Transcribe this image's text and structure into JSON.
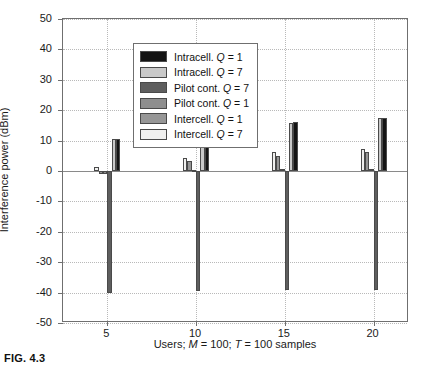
{
  "figure": {
    "caption": "FIG. 4.3"
  },
  "chart_data": {
    "type": "bar",
    "title": "",
    "xlabel": "Users; M = 100; T = 100 samples",
    "ylabel": "Interference power (dBm)",
    "categories": [
      "5",
      "10",
      "15",
      "20"
    ],
    "xlim": [
      2.5,
      22.0
    ],
    "ylim": [
      -50,
      50
    ],
    "ytick_labels": [
      "50",
      "40",
      "30",
      "20",
      "10",
      "0",
      "-10",
      "-20",
      "-30",
      "-40",
      "-50"
    ],
    "yticks": [
      50,
      40,
      30,
      20,
      10,
      0,
      -10,
      -20,
      -30,
      -40,
      -50
    ],
    "xtick_labels": [
      "5",
      "10",
      "15",
      "20"
    ],
    "xticks": [
      5,
      10,
      15,
      20
    ],
    "grid": "dotted-both-axes",
    "legend_position": "upper-left",
    "series": [
      {
        "name": "Intercell. Q = 7",
        "color": "#f0f0ef",
        "values": [
          1.2,
          4.2,
          6.1,
          7.3
        ]
      },
      {
        "name": "Intercell. Q = 1",
        "color": "#969696",
        "values": [
          -0.9,
          3.2,
          5.0,
          6.1
        ]
      },
      {
        "name": "Pilot cont. Q = 1",
        "color": "#8e8e8e",
        "values": [
          -1.0,
          0.2,
          0.5,
          0.6
        ]
      },
      {
        "name": "Pilot cont. Q = 7",
        "color": "#5e5e5e",
        "values": [
          -40.2,
          -39.6,
          -39.3,
          -39.1
        ]
      },
      {
        "name": "Intracell. Q = 7",
        "color": "#c9c9c9",
        "values": [
          10.5,
          14.0,
          15.9,
          17.3
        ]
      },
      {
        "name": "Intracell. Q = 1",
        "color": "#141414",
        "values": [
          10.6,
          14.1,
          16.0,
          17.4
        ]
      }
    ],
    "legend_entries": [
      {
        "label_main": "Intracell.",
        "label_var": "Q",
        "label_val": "= 1",
        "color": "#141414"
      },
      {
        "label_main": "Intracell.",
        "label_var": "Q",
        "label_val": "= 7",
        "color": "#c9c9c9"
      },
      {
        "label_main": "Pilot cont.",
        "label_var": "Q",
        "label_val": "= 7",
        "color": "#5e5e5e"
      },
      {
        "label_main": "Pilot cont.",
        "label_var": "Q",
        "label_val": "= 1",
        "color": "#8e8e8e"
      },
      {
        "label_main": "Intercell.",
        "label_var": "Q",
        "label_val": "= 1",
        "color": "#969696"
      },
      {
        "label_main": "Intercell.",
        "label_var": "Q",
        "label_val": "= 7",
        "color": "#f0f0ef"
      }
    ]
  },
  "axis_title_parts": {
    "x_pre": "Users; ",
    "x_m": "M",
    "x_m_val": " = 100; ",
    "x_t": "T",
    "x_t_val": " = 100 samples"
  }
}
